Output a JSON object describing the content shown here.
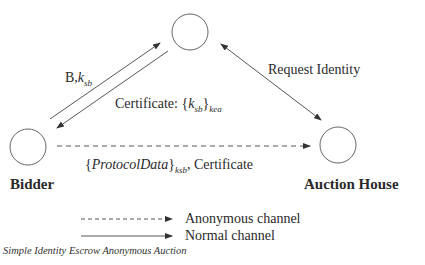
{
  "diagram": {
    "caption": "Simple Identity Escrow Anonymous Auction",
    "nodes": [
      {
        "id": "escrow",
        "label": "",
        "cx": 190,
        "cy": 32,
        "r": 18
      },
      {
        "id": "bidder",
        "label": "Bidder",
        "cx": 28,
        "cy": 147,
        "r": 18
      },
      {
        "id": "auction_house",
        "label": "Auction House",
        "cx": 338,
        "cy": 145,
        "r": 18
      }
    ],
    "edges": [
      {
        "from": "bidder",
        "to": "escrow",
        "style": "solid",
        "label_main": "B,",
        "label_var": "k",
        "label_sub": "sb"
      },
      {
        "from": "escrow",
        "to": "bidder",
        "style": "solid",
        "label_main": "Certificate: {",
        "label_var": "k",
        "label_sub": "sb",
        "label_close": "}",
        "label_outer_sub": "kea"
      },
      {
        "from": "escrow",
        "to": "auction_house",
        "style": "solid-bidirectional",
        "label": "Request Identity"
      },
      {
        "from": "bidder",
        "to": "auction_house",
        "style": "dashed",
        "label_open": "{",
        "label_italic": "ProtocolData",
        "label_close": "}",
        "label_sub": "ksb",
        "label_tail": ", Certificate"
      }
    ],
    "legend": [
      {
        "style": "dashed",
        "label": "Anonymous channel"
      },
      {
        "style": "solid",
        "label": "Normal channel"
      }
    ]
  }
}
